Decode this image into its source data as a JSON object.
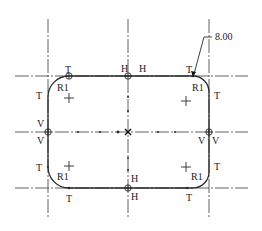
{
  "drawing": {
    "title": "Rounded rectangle sketch with constraints",
    "dimension": {
      "label": "8.00",
      "x": 215,
      "y": 40
    },
    "colors": {
      "line": "#2a2a2a",
      "centerline": "#3a3a3a",
      "background": "#ffffff"
    },
    "radius_labels": [
      {
        "text": "R1",
        "x": 57,
        "y": 91
      },
      {
        "text": "R1",
        "x": 192,
        "y": 91
      },
      {
        "text": "R1",
        "x": 57,
        "y": 180
      },
      {
        "text": "R1",
        "x": 191,
        "y": 180
      }
    ],
    "constraint_labels": [
      {
        "text": "T",
        "x": 65,
        "y": 73,
        "meaning": "tangent"
      },
      {
        "text": "T",
        "x": 186,
        "y": 73,
        "meaning": "tangent"
      },
      {
        "text": "T",
        "x": 36,
        "y": 99,
        "meaning": "tangent"
      },
      {
        "text": "T",
        "x": 214,
        "y": 99,
        "meaning": "tangent"
      },
      {
        "text": "T",
        "x": 36,
        "y": 171,
        "meaning": "tangent"
      },
      {
        "text": "T",
        "x": 214,
        "y": 170,
        "meaning": "tangent"
      },
      {
        "text": "T",
        "x": 66,
        "y": 202,
        "meaning": "tangent"
      },
      {
        "text": "T",
        "x": 186,
        "y": 201,
        "meaning": "tangent"
      },
      {
        "text": "H",
        "x": 121,
        "y": 72,
        "meaning": "horizontal"
      },
      {
        "text": "H",
        "x": 139,
        "y": 72,
        "meaning": "horizontal"
      },
      {
        "text": "H",
        "x": 131,
        "y": 182,
        "meaning": "horizontal"
      },
      {
        "text": "H",
        "x": 131,
        "y": 200,
        "meaning": "horizontal"
      },
      {
        "text": "V",
        "x": 37,
        "y": 127,
        "meaning": "vertical"
      },
      {
        "text": "V",
        "x": 37,
        "y": 144,
        "meaning": "vertical"
      },
      {
        "text": "V",
        "x": 198,
        "y": 144,
        "meaning": "vertical"
      },
      {
        "text": "V",
        "x": 212,
        "y": 144,
        "meaning": "vertical"
      }
    ]
  }
}
